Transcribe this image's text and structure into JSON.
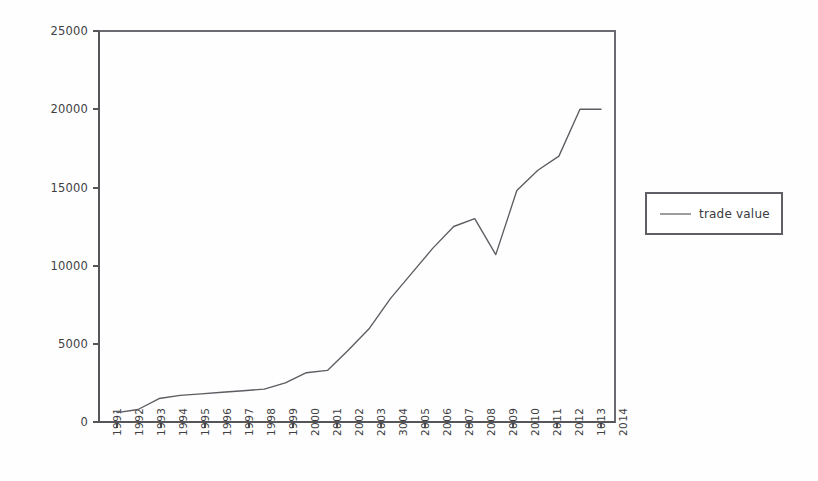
{
  "chart_data": {
    "type": "line",
    "title": "",
    "xlabel": "",
    "ylabel": "",
    "ylim": [
      0,
      25000
    ],
    "ytick_labels": [
      "0",
      "5000",
      "10000",
      "15000",
      "20000",
      "25000"
    ],
    "ytick_values": [
      0,
      5000,
      10000,
      15000,
      20000,
      25000
    ],
    "grid": false,
    "legend_position": "right",
    "legend": [
      "trade value"
    ],
    "categories": [
      "1991",
      "1992",
      "1993",
      "1994",
      "1995",
      "1996",
      "1997",
      "1998",
      "1999",
      "2000",
      "2001",
      "2002",
      "2003",
      "3004",
      "2005",
      "2006",
      "2007",
      "2008",
      "2009",
      "2010",
      "2011",
      "2012",
      "1013",
      "2014"
    ],
    "series": [
      {
        "name": "trade value",
        "values": [
          600,
          800,
          1500,
          1700,
          1800,
          1900,
          2000,
          2100,
          2500,
          3150,
          3300,
          4600,
          6000,
          7900,
          9500,
          11100,
          12500,
          13000,
          10700,
          14800,
          16100,
          17000,
          20000,
          20000
        ]
      }
    ]
  },
  "legend": {
    "entry_label": "trade value"
  }
}
